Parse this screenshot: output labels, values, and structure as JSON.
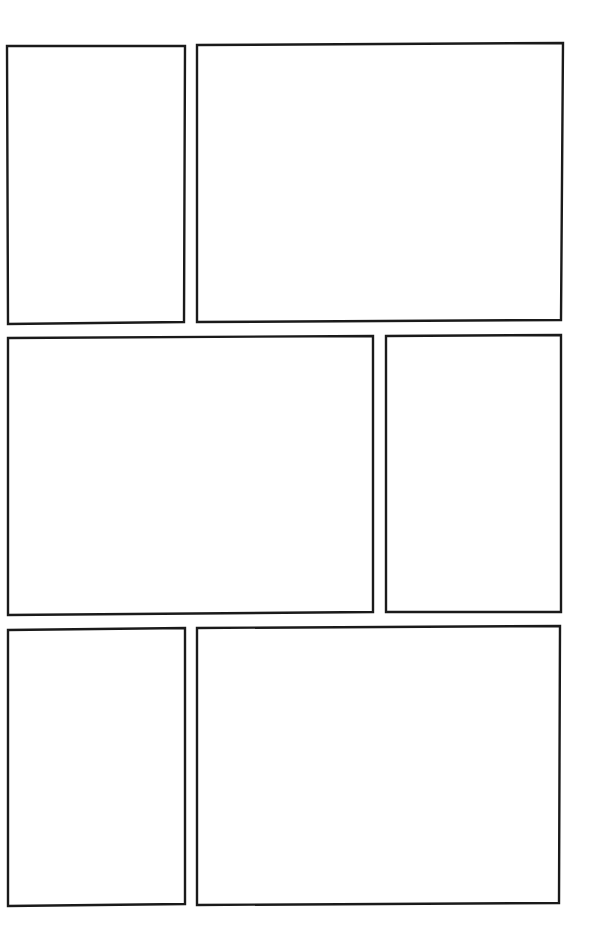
{
  "page": {
    "type": "comic-panel-template",
    "background": "#ffffff",
    "border_color": "#1a1a1a",
    "rows": 3,
    "panels": [
      {
        "id": "panel-1",
        "row": 1,
        "points": "7,46 185,46 184,322 8,324"
      },
      {
        "id": "panel-2",
        "row": 1,
        "points": "197,45 563,43 561,320 197,322"
      },
      {
        "id": "panel-3",
        "row": 2,
        "points": "8,338 373,336 373,612 8,615"
      },
      {
        "id": "panel-4",
        "row": 2,
        "points": "386,336 561,335 561,612 386,612"
      },
      {
        "id": "panel-5",
        "row": 3,
        "points": "8,630 185,628 185,904 8,906"
      },
      {
        "id": "panel-6",
        "row": 3,
        "points": "197,628 560,626 559,903 197,905"
      }
    ]
  }
}
